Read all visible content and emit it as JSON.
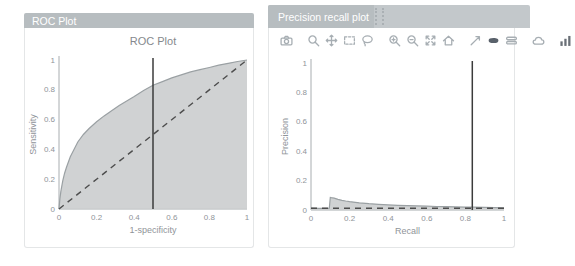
{
  "panels": {
    "roc": {
      "header": "ROC Plot"
    },
    "pr": {
      "header": "Precision recall plot"
    }
  },
  "theme": {
    "header_bg": "#b7bdc0",
    "header_bg_light": "#c3c8cb",
    "header_text": "#ffffff",
    "panel_border": "#e4e6e7",
    "icon_color": "#a7aeb3",
    "icon_active_color": "#59616b",
    "axis_color": "#a8adb0",
    "tick_text_color": "#8f9499",
    "title_color": "#85898d",
    "area_fill": "#cbcdce",
    "area_stroke": "#9aa0a3",
    "dash_color": "#4d4d4d",
    "vline_color": "#3b3b3b"
  },
  "toolbar": {
    "groups": [
      [
        "camera"
      ],
      [
        "zoom",
        "pan",
        "box-select",
        "lasso"
      ],
      [
        "zoom-in",
        "zoom-out",
        "autoscale",
        "reset-axes"
      ],
      [
        "spikelines",
        "hover-closest",
        "hover-compare"
      ],
      [
        "cloud-save"
      ],
      [
        "plotly-logo"
      ]
    ],
    "active": [
      "hover-closest"
    ]
  },
  "chart_data": [
    {
      "id": "roc",
      "type": "area",
      "title": "ROC Plot",
      "xlabel": "1-specificity",
      "ylabel": "Sensitivity",
      "xlim": [
        0,
        1
      ],
      "ylim": [
        0,
        1
      ],
      "xticks": [
        0,
        0.2,
        0.4,
        0.6,
        0.8,
        1
      ],
      "yticks": [
        0,
        0.2,
        0.4,
        0.6,
        0.8,
        1
      ],
      "xtick_labels": [
        "0",
        "0.2",
        "0.4",
        "0.6",
        "0.8",
        "1"
      ],
      "ytick_labels": [
        "0",
        "0.2",
        "0.4",
        "0.6",
        "0.8",
        "1"
      ],
      "grid": false,
      "legend": "none",
      "series": [
        {
          "name": "roc-curve",
          "kind": "area",
          "x": [
            0,
            0.005,
            0.01,
            0.02,
            0.03,
            0.04,
            0.06,
            0.08,
            0.1,
            0.13,
            0.16,
            0.2,
            0.24,
            0.28,
            0.32,
            0.36,
            0.4,
            0.45,
            0.5,
            0.55,
            0.6,
            0.65,
            0.7,
            0.75,
            0.8,
            0.85,
            0.9,
            0.95,
            1.0
          ],
          "y": [
            0,
            0.07,
            0.12,
            0.19,
            0.24,
            0.28,
            0.35,
            0.4,
            0.45,
            0.5,
            0.54,
            0.585,
            0.625,
            0.66,
            0.695,
            0.725,
            0.755,
            0.795,
            0.83,
            0.855,
            0.88,
            0.9,
            0.92,
            0.935,
            0.95,
            0.965,
            0.978,
            0.99,
            1.0
          ]
        },
        {
          "name": "chance-diagonal",
          "kind": "dashed-line",
          "x": [
            0,
            1
          ],
          "y": [
            0,
            1
          ]
        },
        {
          "name": "threshold-vline",
          "kind": "vline",
          "x": 0.5
        }
      ]
    },
    {
      "id": "pr",
      "type": "area",
      "title": "",
      "xlabel": "Recall",
      "ylabel": "Precision",
      "xlim": [
        0,
        1
      ],
      "ylim": [
        0,
        1
      ],
      "xticks": [
        0,
        0.2,
        0.4,
        0.6,
        0.8,
        1
      ],
      "yticks": [
        0,
        0.2,
        0.4,
        0.6,
        0.8,
        1
      ],
      "xtick_labels": [
        "0",
        "0.2",
        "0.4",
        "0.6",
        "0.8",
        "1"
      ],
      "ytick_labels": [
        "0",
        "0.2",
        "0.4",
        "0.6",
        "0.8",
        "1"
      ],
      "grid": false,
      "legend": "none",
      "series": [
        {
          "name": "precision-recall-curve",
          "kind": "area",
          "x": [
            0,
            0.04,
            0.08,
            0.095,
            0.1,
            0.105,
            0.12,
            0.14,
            0.16,
            0.18,
            0.2,
            0.25,
            0.3,
            0.35,
            0.4,
            0.45,
            0.5,
            0.55,
            0.6,
            0.65,
            0.7,
            0.75,
            0.8,
            0.84,
            0.9,
            0.95,
            1.0
          ],
          "y": [
            0.012,
            0.011,
            0.011,
            0.012,
            0.085,
            0.084,
            0.08,
            0.073,
            0.066,
            0.061,
            0.057,
            0.049,
            0.043,
            0.039,
            0.035,
            0.032,
            0.03,
            0.028,
            0.026,
            0.024,
            0.023,
            0.021,
            0.02,
            0.019,
            0.018,
            0.016,
            0.015
          ]
        },
        {
          "name": "baseline-dashed",
          "kind": "dashed-line",
          "x": [
            0,
            1
          ],
          "y": [
            0.012,
            0.012
          ]
        },
        {
          "name": "threshold-vline",
          "kind": "vline",
          "x": 0.836
        }
      ]
    }
  ]
}
